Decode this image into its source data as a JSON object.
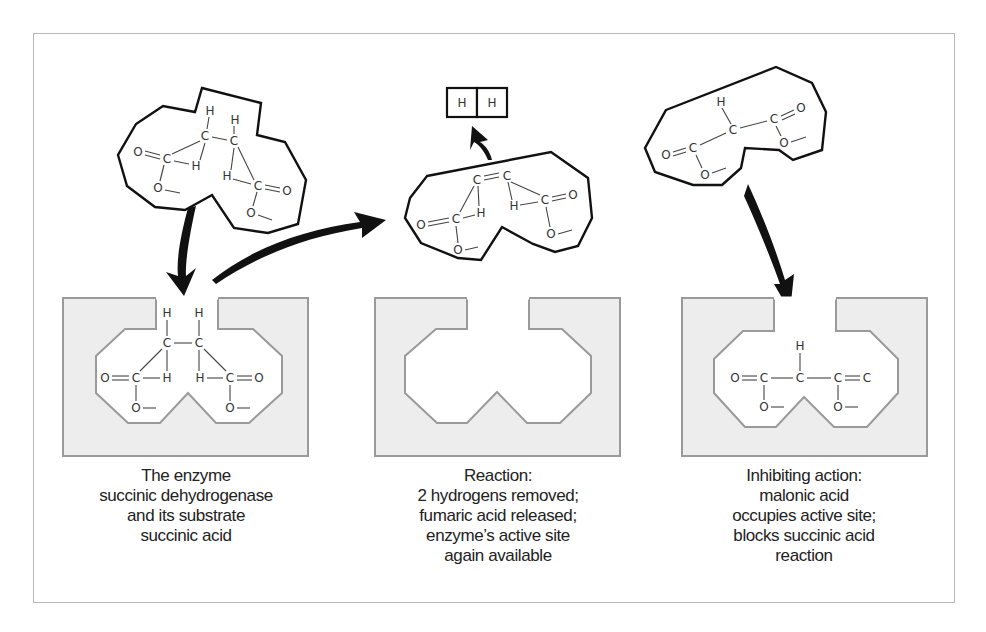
{
  "figure": {
    "panels": [
      {
        "id": "substrate",
        "caption": [
          "The enzyme",
          "succinic dehydrogenase",
          "and its substrate",
          "succinic acid"
        ],
        "free_molecule": "succinic acid",
        "bound_molecule": "succinic acid"
      },
      {
        "id": "reaction",
        "caption": [
          "Reaction:",
          "2 hydrogens removed;",
          "fumaric acid released;",
          "enzyme’s active site",
          "again available"
        ],
        "free_molecule": "fumaric acid",
        "released": [
          "H",
          "H"
        ]
      },
      {
        "id": "inhibition",
        "caption": [
          "Inhibiting action:",
          "malonic acid",
          "occupies active site;",
          "blocks succinic acid",
          "reaction"
        ],
        "free_molecule": "malonic acid",
        "bound_molecule": "malonic acid"
      }
    ],
    "atoms": {
      "H": "H",
      "C": "C",
      "O": "O"
    },
    "colors": {
      "enzyme_fill": "#ededed",
      "enzyme_stroke": "#9a9a9a",
      "molecule_outline": "#111111",
      "bond": "#444444",
      "frame": "#b8b8b8"
    }
  }
}
